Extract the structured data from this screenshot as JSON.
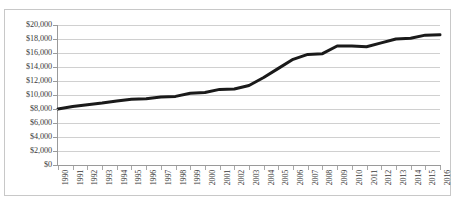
{
  "chart_title": "",
  "frame": {
    "border_color": "#c8c8c8",
    "background": "#ffffff"
  },
  "chart_data": {
    "type": "line",
    "title": "",
    "subtitle": "",
    "xlabel": "",
    "ylabel": "",
    "categories": [
      "1990",
      "1991",
      "1992",
      "1993",
      "1994",
      "1995",
      "1996",
      "1997",
      "1998",
      "1999",
      "2000",
      "2001",
      "2002",
      "2003",
      "2004",
      "2005",
      "2006",
      "2007",
      "2008",
      "2009",
      "2010",
      "2011",
      "2012",
      "2013",
      "2014",
      "2015",
      "2016"
    ],
    "values": [
      8000,
      8350,
      8600,
      8850,
      9150,
      9400,
      9450,
      9700,
      9800,
      10250,
      10350,
      10800,
      10850,
      11350,
      12500,
      13800,
      15100,
      15800,
      15900,
      17000,
      17000,
      16900,
      17450,
      18000,
      18100,
      18550,
      18600
    ],
    "series": [
      {
        "name": "",
        "color": "#1a1a1a",
        "line_width": 3,
        "values": [
          8000,
          8350,
          8600,
          8850,
          9150,
          9400,
          9450,
          9700,
          9800,
          10250,
          10350,
          10800,
          10850,
          11350,
          12500,
          13800,
          15100,
          15800,
          15900,
          17000,
          17000,
          16900,
          17450,
          18000,
          18100,
          18550,
          18600
        ]
      }
    ],
    "ylim": [
      0,
      20000
    ],
    "ytick_step": 2000,
    "ytick_labels": [
      "$20,000",
      "$18,000",
      "$16,000",
      "$14,000",
      "$12,000",
      "$10,000",
      "$8,000",
      "$6,000",
      "$4,000",
      "$2,000",
      "$0"
    ],
    "ytick_values": [
      20000,
      18000,
      16000,
      14000,
      12000,
      10000,
      8000,
      6000,
      4000,
      2000,
      0
    ],
    "grid": true,
    "grid_color": "#d0d0d0",
    "legend": false,
    "legend_position": "none",
    "markers": false,
    "annotations": []
  }
}
